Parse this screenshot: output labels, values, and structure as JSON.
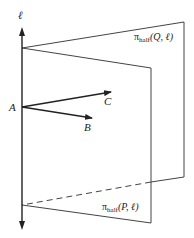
{
  "diagram": {
    "type": "half-planes sharing a common line",
    "line": {
      "label": "ℓ"
    },
    "point": {
      "label": "A"
    },
    "vectors": [
      {
        "label": "C"
      },
      {
        "label": "B"
      }
    ],
    "half_planes": [
      {
        "pi": "π",
        "sub": "half",
        "args": "(Q, ℓ)"
      },
      {
        "pi": "π",
        "sub": "half",
        "args": "(P, ℓ)"
      }
    ],
    "colors": {
      "stroke": "#222222",
      "background": "#ffffff"
    }
  }
}
